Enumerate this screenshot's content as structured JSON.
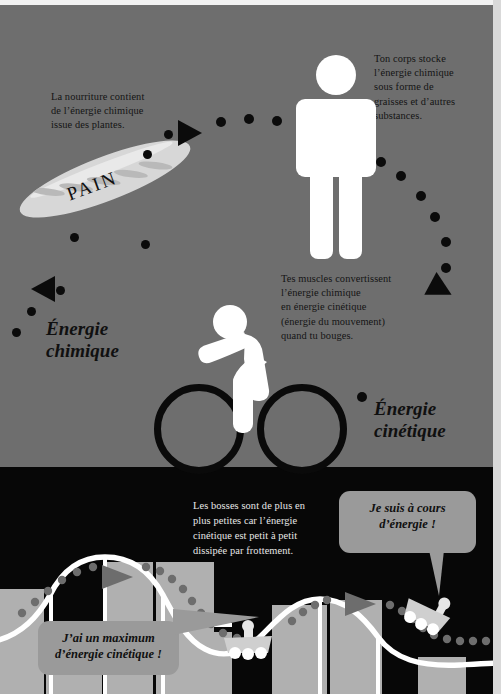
{
  "page": {
    "language": "fr"
  },
  "colors": {
    "background_top_strip": "#f2f2f2",
    "upper_panel": "#6e6e6e",
    "lower_panel": "#070707",
    "right_strip": "#d9d9d9",
    "figure_white": "#ffffff",
    "ink_black": "#0b0b0b",
    "bubble_gray": "#9a9a9a",
    "baguette": "#d7d7d7",
    "track_white": "#ffffff",
    "pillar_gray": "#b0b0b0"
  },
  "upper_panel": {
    "callouts": [
      {
        "id": "food-callout",
        "text": "La nourriture contient de l’énergie chimique issue des plantes.",
        "lines": [
          "La nourriture contient",
          "de l’énergie chimique",
          "issue des plantes."
        ]
      },
      {
        "id": "body-storage-callout",
        "text": "Ton corps stocke l’énergie chimique sous forme de graisses et d’autres substances.",
        "lines": [
          "Ton corps stocke",
          "l’énergie chimique",
          "sous forme de",
          "graisses et d’autres",
          "substances."
        ]
      },
      {
        "id": "muscle-callout",
        "text": "Tes muscles convertissent l’énergie chimique en énergie cinétique (énergie du mouvement) quand tu bouges.",
        "lines": [
          "Tes muscles convertissent",
          "l’énergie chimique",
          "en énergie cinétique",
          "(énergie du mouvement)",
          "quand tu bouges."
        ]
      }
    ],
    "labels": [
      {
        "id": "chemical-energy-label",
        "lines": [
          "Énergie",
          "chimique"
        ],
        "text": "Énergie chimique"
      },
      {
        "id": "kinetic-energy-label",
        "lines": [
          "Énergie",
          "cinétique"
        ],
        "text": "Énergie cinétique"
      }
    ],
    "bread": {
      "label": "PAIN"
    },
    "figures": [
      {
        "id": "standing-person",
        "name": "standing-person-pictogram"
      },
      {
        "id": "cyclist",
        "name": "cyclist-pictogram"
      }
    ]
  },
  "lower_panel": {
    "caption": {
      "id": "friction-caption",
      "text": "Les bosses sont de plus en plus petites car l’énergie cinétique est petit à petit dissipée par frottement.",
      "lines": [
        "Les bosses sont de plus en",
        "plus petites car l’énergie",
        "cinétique est petit à petit",
        "dissipée par frottement."
      ]
    },
    "bubbles": [
      {
        "id": "max-kinetic-bubble",
        "text": "J’ai un maximum d’énergie cinétique !",
        "lines": [
          "J’ai un maximum",
          "d’énergie cinétique !"
        ]
      },
      {
        "id": "out-of-energy-bubble",
        "text": "Je suis à cours d’énergie !",
        "lines": [
          "Je suis à cours",
          "d’énergie !"
        ]
      }
    ],
    "carts": [
      {
        "id": "cart-first-dip",
        "name": "roller-coaster-cart"
      },
      {
        "id": "cart-second-dip",
        "name": "roller-coaster-cart"
      }
    ]
  }
}
